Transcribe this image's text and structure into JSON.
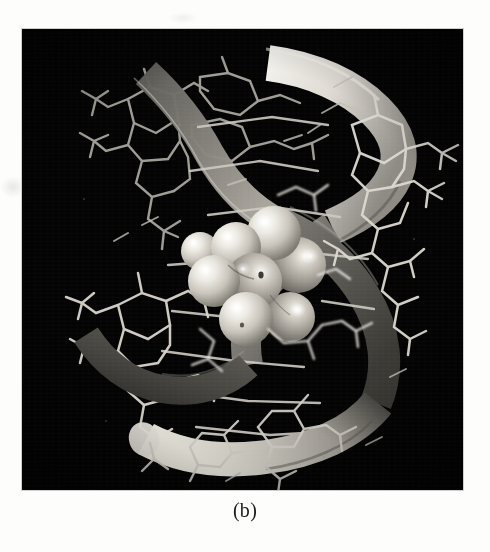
{
  "figure": {
    "caption": "(b)",
    "panel_background": "#030303",
    "page_background": "#fdfdfc",
    "panel": {
      "x": 22,
      "y": 29,
      "width": 441,
      "height": 461
    },
    "rendering_notes": {
      "backbone_style": "ribbon",
      "bases_style": "wireframe-sticks",
      "ligand_style": "space-filling-cpk",
      "colormode": "grayscale"
    },
    "palette": {
      "background": "#030303",
      "ribbon_bright": "#e9e7e2",
      "ribbon_mid": "#9a9894",
      "ribbon_dark": "#56544f",
      "ribbon_shadow": "#2a2926",
      "stick_bright": "#f2f0eb",
      "stick_mid": "#b9b6ae",
      "stick_dim": "#7d7a74",
      "sphere_light": "#efece5",
      "sphere_mid": "#b4b0a7",
      "sphere_dark": "#6e6b64",
      "specular": "#ffffff"
    }
  },
  "ribbons": [
    {
      "name": "strand-1-upper",
      "tone": "bright",
      "path": "M 255 32 C 300 40, 330 58, 352 80 C 372 100, 380 120, 372 142 C 364 164, 340 182, 312 196",
      "width": 34,
      "shade_start": "#f0eee9",
      "shade_end": "#8d8a84"
    },
    {
      "name": "strand-1-mid",
      "tone": "mid",
      "path": "M 312 196 C 290 210, 268 226, 250 248 C 230 272, 222 300, 228 330",
      "width": 30,
      "shade_start": "#8d8a84",
      "shade_end": "#5d5a55"
    },
    {
      "name": "strand-2-upper-left",
      "tone": "mid",
      "path": "M 132 50 C 155 70, 175 96, 190 124 C 206 152, 224 176, 250 192",
      "width": 30,
      "shade_start": "#6e6b66",
      "shade_end": "#a8a49c"
    },
    {
      "name": "strand-2-descending",
      "tone": "dark",
      "path": "M 250 192 C 284 208, 316 232, 338 266 C 360 300, 366 336, 354 370",
      "width": 30,
      "shade_start": "#7a7771",
      "shade_end": "#4a4843"
    },
    {
      "name": "strand-2-lower",
      "tone": "bright",
      "path": "M 354 370 C 330 400, 290 418, 244 424 C 200 430, 160 424, 128 408",
      "width": 32,
      "shade_start": "#4a4843",
      "shade_end": "#e4e1da"
    },
    {
      "name": "strand-1-lower-left",
      "tone": "dark",
      "path": "M 228 330 C 206 352, 176 362, 142 356 C 110 350, 84 330, 66 304",
      "width": 28,
      "shade_start": "#5d5a55",
      "shade_end": "#35332f"
    }
  ],
  "ligand_spheres": [
    {
      "cx": 214,
      "cy": 218,
      "r": 24,
      "highlight_x": 205,
      "highlight_y": 206,
      "shade": "light"
    },
    {
      "cx": 252,
      "cy": 204,
      "r": 26,
      "highlight_x": 242,
      "highlight_y": 192,
      "shade": "light"
    },
    {
      "cx": 192,
      "cy": 250,
      "r": 25,
      "highlight_x": 182,
      "highlight_y": 238,
      "shade": "light"
    },
    {
      "cx": 232,
      "cy": 250,
      "r": 27,
      "highlight_x": 220,
      "highlight_y": 238,
      "shade": "mid"
    },
    {
      "cx": 276,
      "cy": 236,
      "r": 27,
      "highlight_x": 286,
      "highlight_y": 226,
      "shade": "mid"
    },
    {
      "cx": 224,
      "cy": 288,
      "r": 26,
      "highlight_x": 214,
      "highlight_y": 276,
      "shade": "light"
    },
    {
      "cx": 268,
      "cy": 286,
      "r": 24,
      "highlight_x": 262,
      "highlight_y": 276,
      "shade": "mid"
    },
    {
      "cx": 178,
      "cy": 222,
      "r": 18,
      "highlight_x": 171,
      "highlight_y": 213,
      "shade": "light"
    }
  ],
  "labels": {
    "panel_alt": "Space-filling model bound within the minor groove of a B-form DNA duplex",
    "caption_text": "(b)"
  }
}
